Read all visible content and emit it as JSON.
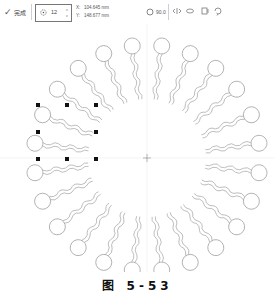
{
  "toolbar": {
    "apply_label": "完成",
    "apply_icon": "check-icon",
    "copies_icon": "rotation-copies-icon",
    "copies_value": "12",
    "x_label": "X:",
    "x_value": "104.645 mm",
    "y_label": "Y:",
    "y_value": "148.677 mm",
    "angle_icon": "angle-icon",
    "angle_value": "90.0",
    "angle_unit": "°",
    "tools": [
      "mirror-icon",
      "mirror-vertical-icon",
      "align-icon",
      "rotate-icon"
    ]
  },
  "drawing": {
    "shape": "lipid-molecule",
    "count": 24,
    "selected_index": 9,
    "stroke_color": "#9a9a9a",
    "handle_color": "#111111",
    "guide_color": "#e6e6e6"
  },
  "caption": "图 5-53"
}
